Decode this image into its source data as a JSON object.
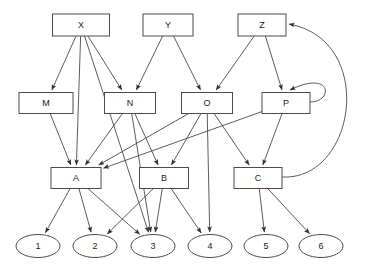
{
  "diagram": {
    "background_color": "#ffffff",
    "node_stroke_color": "#4a4a4a",
    "edge_stroke_color": "#4a4a4a",
    "label_color": "#1a1a1a",
    "levels": [
      {
        "name": "top-level",
        "shape": "rect",
        "labels": [
          "X",
          "Y",
          "Z"
        ]
      },
      {
        "name": "middle-level",
        "shape": "rect",
        "labels": [
          "M",
          "N",
          "O",
          "P"
        ]
      },
      {
        "name": "lower-level",
        "shape": "rect",
        "labels": [
          "A",
          "B",
          "C"
        ]
      },
      {
        "name": "leaf-level",
        "shape": "ellipse",
        "labels": [
          "1",
          "2",
          "3",
          "4",
          "5",
          "6"
        ]
      }
    ],
    "nodes": [
      {
        "id": "X",
        "label": "X",
        "shape": "rect",
        "cx": 81,
        "cy": 25,
        "w": 57,
        "h": 22
      },
      {
        "id": "Y",
        "label": "Y",
        "shape": "rect",
        "cx": 168,
        "cy": 25,
        "w": 50,
        "h": 22
      },
      {
        "id": "Z",
        "label": "Z",
        "shape": "rect",
        "cx": 262,
        "cy": 25,
        "w": 48,
        "h": 22
      },
      {
        "id": "M",
        "label": "M",
        "shape": "rect",
        "cx": 46,
        "cy": 103,
        "w": 54,
        "h": 21
      },
      {
        "id": "N",
        "label": "N",
        "shape": "rect",
        "cx": 130,
        "cy": 103,
        "w": 51,
        "h": 21
      },
      {
        "id": "O",
        "label": "O",
        "shape": "rect",
        "cx": 207,
        "cy": 103,
        "w": 51,
        "h": 21
      },
      {
        "id": "P",
        "label": "P",
        "shape": "rect",
        "cx": 286,
        "cy": 103,
        "w": 48,
        "h": 21
      },
      {
        "id": "A",
        "label": "A",
        "shape": "rect",
        "cx": 76,
        "cy": 178,
        "w": 50,
        "h": 21
      },
      {
        "id": "B",
        "label": "B",
        "shape": "rect",
        "cx": 164,
        "cy": 178,
        "w": 49,
        "h": 21
      },
      {
        "id": "C",
        "label": "C",
        "shape": "rect",
        "cx": 258,
        "cy": 178,
        "w": 48,
        "h": 21
      },
      {
        "id": "1",
        "label": "1",
        "shape": "ellipse",
        "cx": 38,
        "cy": 246,
        "w": 44,
        "h": 23
      },
      {
        "id": "2",
        "label": "2",
        "shape": "ellipse",
        "cx": 95,
        "cy": 246,
        "w": 44,
        "h": 23
      },
      {
        "id": "3",
        "label": "3",
        "shape": "ellipse",
        "cx": 153,
        "cy": 246,
        "w": 44,
        "h": 23
      },
      {
        "id": "4",
        "label": "4",
        "shape": "ellipse",
        "cx": 210,
        "cy": 246,
        "w": 44,
        "h": 23
      },
      {
        "id": "5",
        "label": "5",
        "shape": "ellipse",
        "cx": 266,
        "cy": 246,
        "w": 44,
        "h": 23
      },
      {
        "id": "6",
        "label": "6",
        "shape": "ellipse",
        "cx": 321,
        "cy": 246,
        "w": 44,
        "h": 23
      }
    ],
    "edges": [
      {
        "from": "X",
        "to": "M",
        "kind": "straight"
      },
      {
        "from": "X",
        "to": "N",
        "kind": "straight"
      },
      {
        "from": "X",
        "to": "A",
        "kind": "straight"
      },
      {
        "from": "X",
        "to": "3",
        "kind": "straight"
      },
      {
        "from": "Y",
        "to": "N",
        "kind": "straight"
      },
      {
        "from": "Y",
        "to": "O",
        "kind": "straight"
      },
      {
        "from": "Z",
        "to": "O",
        "kind": "straight"
      },
      {
        "from": "Z",
        "to": "P",
        "kind": "straight"
      },
      {
        "from": "M",
        "to": "A",
        "kind": "straight"
      },
      {
        "from": "N",
        "to": "A",
        "kind": "straight"
      },
      {
        "from": "N",
        "to": "B",
        "kind": "straight"
      },
      {
        "from": "N",
        "to": "3",
        "kind": "straight"
      },
      {
        "from": "O",
        "to": "A",
        "kind": "straight"
      },
      {
        "from": "O",
        "to": "B",
        "kind": "straight"
      },
      {
        "from": "O",
        "to": "C",
        "kind": "straight"
      },
      {
        "from": "O",
        "to": "4",
        "kind": "straight"
      },
      {
        "from": "P",
        "to": "A",
        "kind": "straight"
      },
      {
        "from": "P",
        "to": "C",
        "kind": "straight"
      },
      {
        "from": "P",
        "to": "P",
        "kind": "self-loop"
      },
      {
        "from": "A",
        "to": "1",
        "kind": "straight"
      },
      {
        "from": "A",
        "to": "2",
        "kind": "straight"
      },
      {
        "from": "A",
        "to": "3",
        "kind": "straight"
      },
      {
        "from": "B",
        "to": "2",
        "kind": "straight"
      },
      {
        "from": "B",
        "to": "3",
        "kind": "straight"
      },
      {
        "from": "B",
        "to": "4",
        "kind": "straight"
      },
      {
        "from": "C",
        "to": "5",
        "kind": "straight"
      },
      {
        "from": "C",
        "to": "6",
        "kind": "straight"
      },
      {
        "from": "C",
        "to": "Z",
        "kind": "feedback-curve"
      }
    ]
  }
}
